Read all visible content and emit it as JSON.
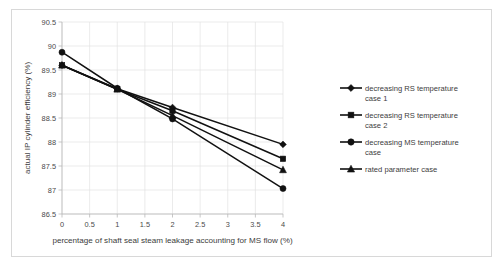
{
  "chart_data": {
    "type": "line",
    "title": "",
    "xlabel": "percentage of shaft seal steam leakage accounting for MS flow (%)",
    "ylabel": "actual IP cylinder efficiency (%)",
    "x": [
      0,
      1,
      2,
      4
    ],
    "xlim": [
      0,
      4
    ],
    "ylim": [
      86.5,
      90.5
    ],
    "xticks": [
      "0",
      "0.5",
      "1",
      "1.5",
      "2",
      "2.5",
      "3",
      "3.5",
      "4"
    ],
    "xtick_values": [
      0,
      0.5,
      1,
      1.5,
      2,
      2.5,
      3,
      3.5,
      4
    ],
    "yticks": [
      "86.5",
      "87",
      "87.5",
      "88",
      "88.5",
      "89",
      "89.5",
      "90",
      "90.5"
    ],
    "ytick_values": [
      86.5,
      87,
      87.5,
      88,
      88.5,
      89,
      89.5,
      90,
      90.5
    ],
    "grid": true,
    "legend_position": "right",
    "series": [
      {
        "name": "decreasing RS temperature case 1",
        "marker": "diamond",
        "color": "#111111",
        "values": [
          89.6,
          89.11,
          88.72,
          87.95
        ]
      },
      {
        "name": "decreasing RS temperature case 2",
        "marker": "square",
        "color": "#111111",
        "values": [
          89.6,
          89.1,
          88.65,
          87.65
        ]
      },
      {
        "name": "decreasing MS temperature case",
        "marker": "circle",
        "color": "#111111",
        "values": [
          89.87,
          89.12,
          88.48,
          87.03
        ]
      },
      {
        "name": "rated parameter case",
        "marker": "triangle",
        "color": "#111111",
        "values": [
          89.6,
          89.1,
          88.55,
          87.42
        ]
      }
    ]
  },
  "legend": {
    "entries": [
      {
        "label_line1": "decreasing RS temperature",
        "label_line2": "case 1",
        "marker": "diamond"
      },
      {
        "label_line1": "decreasing RS temperature",
        "label_line2": "case 2",
        "marker": "square"
      },
      {
        "label_line1": "decreasing MS temperature",
        "label_line2": "case",
        "marker": "circle"
      },
      {
        "label_line1": "rated parameter case",
        "label_line2": "",
        "marker": "triangle"
      }
    ]
  },
  "axes": {
    "x_title": "percentage of shaft seal steam leakage accounting for MS flow (%)",
    "y_title": "actual IP cylinder efficiency (%)",
    "x_tick_labels": [
      "0",
      "0.5",
      "1",
      "1.5",
      "2",
      "2.5",
      "3",
      "3.5",
      "4"
    ],
    "y_tick_labels": [
      "90.5",
      "90",
      "89.5",
      "89",
      "88.5",
      "88",
      "87.5",
      "87",
      "86.5"
    ]
  },
  "style": {
    "line_color": "#111111",
    "grid_color": "#e2e2e2",
    "axis_color": "#b9b9b9",
    "text_color": "#3c3c3c",
    "background": "#ffffff",
    "frame_color": "#d8d8d8"
  }
}
